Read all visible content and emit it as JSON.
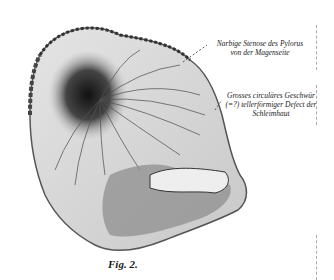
{
  "figure": {
    "labels": [
      {
        "line1": "Narbige Stenose des Pylorus",
        "line2": "von der Magenseite"
      },
      {
        "line1": "Grosses circuläres Geschwür",
        "line2": "(=?) tellerförmiger Defect der",
        "line3": "Schleimhaut"
      }
    ],
    "caption": "Fig. 2."
  },
  "colors": {
    "background": "#ffffff",
    "ink": "#1a1a1a",
    "shadow": "#2a2a2a",
    "tissue": "#d8d8d8"
  }
}
